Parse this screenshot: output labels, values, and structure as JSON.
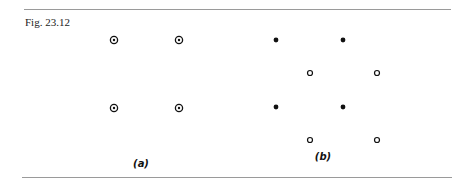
{
  "figure": {
    "caption": "Fig. 23.12",
    "panels": [
      {
        "id": "a",
        "label": "(a)",
        "label_pos": [
          141,
          165
        ],
        "markers": [
          {
            "type": "circle-dot",
            "x": 114,
            "y": 40
          },
          {
            "type": "circle-dot",
            "x": 179,
            "y": 40
          },
          {
            "type": "circle-dot",
            "x": 114,
            "y": 108
          },
          {
            "type": "circle-dot",
            "x": 179,
            "y": 108
          }
        ]
      },
      {
        "id": "b",
        "label": "(b)",
        "label_pos": [
          323,
          158
        ],
        "markers": [
          {
            "type": "filled",
            "x": 276,
            "y": 40
          },
          {
            "type": "filled",
            "x": 343,
            "y": 40
          },
          {
            "type": "open",
            "x": 310,
            "y": 73
          },
          {
            "type": "open",
            "x": 377,
            "y": 73
          },
          {
            "type": "filled",
            "x": 276,
            "y": 107
          },
          {
            "type": "filled",
            "x": 343,
            "y": 107
          },
          {
            "type": "open",
            "x": 310,
            "y": 140
          },
          {
            "type": "open",
            "x": 377,
            "y": 140
          }
        ]
      }
    ],
    "colors": {
      "ink": "#111111",
      "rule": "#9a9a9a"
    }
  }
}
